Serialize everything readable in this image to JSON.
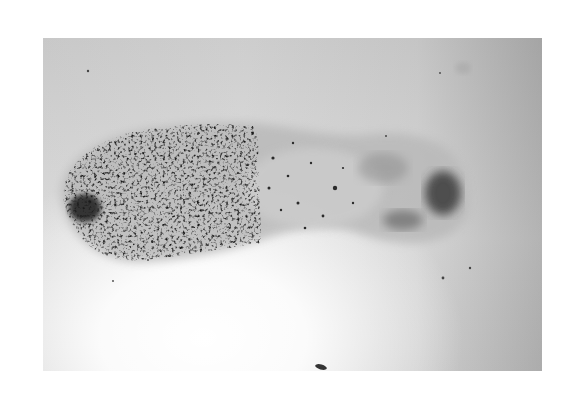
{
  "image": {
    "description": "Grayscale micrograph of an elongated stained specimen with dense dark granules concentrated at the left end and a lighter diffuse body extending right with a dark patch near the right tip",
    "colors": {
      "background": "#ffffff",
      "field_light": "#f0f0f0",
      "field_dark": "#bdbdbd",
      "specimen_body": "#b8b8b8",
      "granules": "#1a1a1a"
    }
  }
}
